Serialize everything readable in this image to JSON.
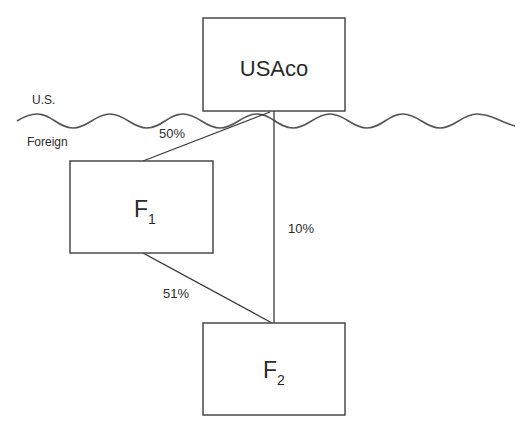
{
  "border": {
    "upper_label": "U.S.",
    "lower_label": "Foreign"
  },
  "entities": {
    "parent": {
      "name": "USAco"
    },
    "f1": {
      "name": "F",
      "subscript": "1"
    },
    "f2": {
      "name": "F",
      "subscript": "2"
    }
  },
  "ownership": {
    "usaco_to_f1": "50%",
    "usaco_to_f2": "10%",
    "f1_to_f2": "51%"
  },
  "colors": {
    "line": "#3a3a3a",
    "text": "#2b2b2b",
    "background": "#ffffff"
  }
}
